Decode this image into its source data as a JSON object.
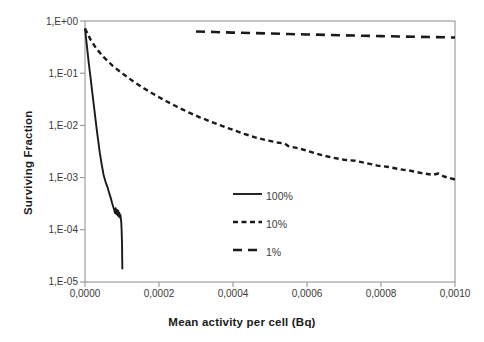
{
  "chart_data": {
    "type": "line",
    "title": "",
    "xlabel": "Mean activity per cell (Bq)",
    "ylabel": "Surviving Fraction",
    "xlim": [
      0.0,
      0.001
    ],
    "ylim": [
      1e-05,
      1.0
    ],
    "yscale": "log",
    "xscale": "linear",
    "grid": false,
    "legend_position": "center",
    "xticks": [
      "0,0000",
      "0,0002",
      "0,0004",
      "0,0006",
      "0,0008",
      "0,0010"
    ],
    "xtick_values": [
      0.0,
      0.0002,
      0.0004,
      0.0006,
      0.0008,
      0.001
    ],
    "yticks": [
      "1,E+00",
      "1,E-01",
      "1,E-02",
      "1,E-03",
      "1,E-04",
      "1,E-05"
    ],
    "ytick_values": [
      1.0,
      0.1,
      0.01,
      0.001,
      0.0001,
      1e-05
    ],
    "series": [
      {
        "name": "100%",
        "style": "solid",
        "color": "#1a1a1a",
        "x": [
          0.0,
          5e-06,
          1e-05,
          1.5e-05,
          2e-05,
          2.5e-05,
          3e-05,
          3.5e-05,
          4e-05,
          4.5e-05,
          5e-05,
          5.5e-05,
          6e-05,
          6.5e-05,
          7e-05,
          7.3e-05,
          7.6e-05,
          7.9e-05,
          8.1e-05,
          8.3e-05,
          8.5e-05,
          8.7e-05,
          8.8e-05,
          9e-05,
          9.1e-05,
          9.3e-05,
          9.5e-05,
          9.6e-05,
          9.7e-05,
          9.8e-05,
          9.9e-05,
          0.0001,
          0.0001005,
          0.000101
        ],
        "y": [
          0.72,
          0.34,
          0.16,
          0.082,
          0.041,
          0.021,
          0.0105,
          0.0055,
          0.003,
          0.0018,
          0.00115,
          0.00085,
          0.00068,
          0.00052,
          0.0004,
          0.00033,
          0.00028,
          0.00024,
          0.00021,
          0.00026,
          0.0002,
          0.00024,
          0.00019,
          0.00023,
          0.00018,
          0.00021,
          0.00017,
          0.00019,
          0.00016,
          0.00014,
          0.0001,
          5.5e-05,
          3e-05,
          1.75e-05
        ]
      },
      {
        "name": "10%",
        "style": "dashed-short",
        "color": "#1a1a1a",
        "x": [
          0.0,
          1.5e-05,
          3e-05,
          5e-05,
          7.5e-05,
          0.0001,
          0.00013,
          0.00016,
          0.00019,
          0.00022,
          0.00025,
          0.00028,
          0.00031,
          0.00034,
          0.00037,
          0.0004,
          0.00043,
          0.00046,
          0.00049,
          0.00052,
          0.00054,
          0.00055,
          0.00058,
          0.00061,
          0.00064,
          0.00067,
          0.0007,
          0.00073,
          0.00076,
          0.00079,
          0.00082,
          0.00085,
          0.00088,
          0.00091,
          0.00094,
          0.000955,
          0.00097,
          0.001
        ],
        "y": [
          0.72,
          0.44,
          0.3,
          0.205,
          0.138,
          0.1,
          0.07,
          0.051,
          0.038,
          0.029,
          0.0225,
          0.0178,
          0.0143,
          0.0118,
          0.0098,
          0.0082,
          0.0069,
          0.0059,
          0.0052,
          0.0047,
          0.0045,
          0.004,
          0.0036,
          0.0031,
          0.0027,
          0.0024,
          0.0022,
          0.0021,
          0.0019,
          0.0017,
          0.0016,
          0.00145,
          0.00135,
          0.00122,
          0.00113,
          0.0012,
          0.00105,
          0.00092
        ]
      },
      {
        "name": "1%",
        "style": "dashed-long",
        "color": "#1a1a1a",
        "x": [
          0.0003,
          0.00035,
          0.0004,
          0.00045,
          0.0005,
          0.00055,
          0.0006,
          0.00065,
          0.0007,
          0.00075,
          0.0008,
          0.00085,
          0.0009,
          0.00095,
          0.001
        ],
        "y": [
          0.63,
          0.615,
          0.6,
          0.588,
          0.575,
          0.563,
          0.552,
          0.542,
          0.532,
          0.522,
          0.513,
          0.505,
          0.497,
          0.49,
          0.483
        ]
      }
    ]
  },
  "legend": {
    "entries": [
      {
        "label": "100%",
        "style": "solid"
      },
      {
        "label": "10%",
        "style": "dashed-short"
      },
      {
        "label": "1%",
        "style": "dashed-long"
      }
    ]
  },
  "axes": {
    "frame_color": "#8c8c8c",
    "tick_color": "#8c8c8c",
    "text_color": "#3a3a3a"
  }
}
